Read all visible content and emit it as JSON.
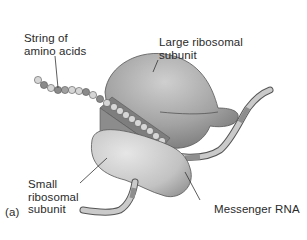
{
  "figure": {
    "panel_label": "(a)",
    "labels": {
      "amino_acids": "String of\namino acids",
      "large_subunit": "Large ribosomal\nsubunit",
      "small_subunit": "Small\nribosomal\nsubunit",
      "mrna": "Messenger RNA"
    }
  },
  "colors": {
    "background": "#ffffff",
    "text": "#2a2a2a",
    "large_subunit": "#a6a6a6",
    "small_subunit": "#c4c4c4",
    "tunnel": "#7e7e7e",
    "bead_light": "#d6d6d6",
    "bead_dark": "#8a8a8a",
    "mrna_light": "#c9c9c9",
    "mrna_dark": "#8e8e8e",
    "outline": "#555555"
  }
}
